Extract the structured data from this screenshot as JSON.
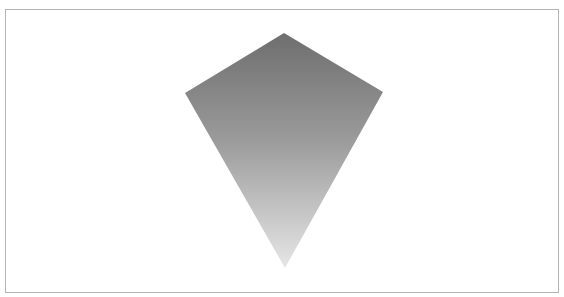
{
  "figure": {
    "frame": {
      "x": 5,
      "y": 9,
      "width": 554,
      "height": 284,
      "border_color": "#b4b4b4",
      "background": "#ffffff"
    },
    "kite": {
      "shape": "kite",
      "vertices": {
        "top": [
          284,
          33
        ],
        "right": [
          383,
          92
        ],
        "bottom": [
          285,
          268
        ],
        "left": [
          185,
          93
        ]
      },
      "points": "284,33 383,92 285,268 185,93",
      "fill": "vertical-gradient",
      "gradient_stops": [
        {
          "offset": "0%",
          "color": "#6e6e6e"
        },
        {
          "offset": "45%",
          "color": "#9a9a9a"
        },
        {
          "offset": "100%",
          "color": "#e6e6e6"
        }
      ]
    }
  }
}
